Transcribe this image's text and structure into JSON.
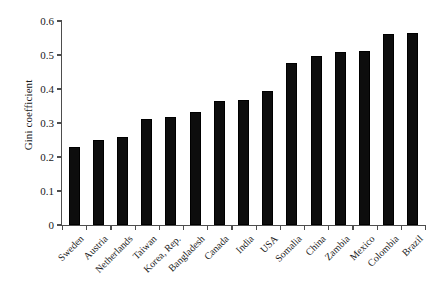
{
  "chart_data": {
    "type": "bar",
    "title": "",
    "subtitle": "",
    "xlabel": "",
    "ylabel": "Gini coefficient",
    "ylim": [
      0,
      0.6
    ],
    "yticks": [
      "0",
      "0.1",
      "0.2",
      "0.3",
      "0.4",
      "0.5",
      "0.6"
    ],
    "ytick_values": [
      0,
      0.1,
      0.2,
      0.3,
      0.4,
      0.5,
      0.6
    ],
    "grid": false,
    "legend": false,
    "legend_position": "none",
    "bar_color": "#0d0d0d",
    "axis_color": "#4d4d4d",
    "background": "#ffffff",
    "categories": [
      "Sweden",
      "Austria",
      "Netherlands",
      "Taiwan",
      "Korea, Rep.",
      "Bangladesh",
      "Canada",
      "India",
      "USA",
      "Somalia",
      "China",
      "Zambia",
      "Mexico",
      "Colombia",
      "Brazil"
    ],
    "values": [
      0.23,
      0.25,
      0.26,
      0.313,
      0.317,
      0.331,
      0.365,
      0.368,
      0.394,
      0.476,
      0.497,
      0.508,
      0.511,
      0.562,
      0.565
    ]
  }
}
